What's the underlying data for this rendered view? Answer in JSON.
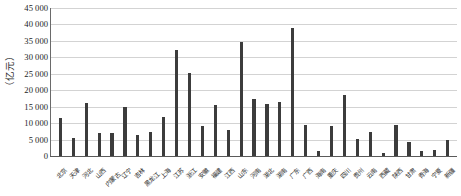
{
  "chart_data": {
    "type": "bar",
    "title": "",
    "xlabel": "",
    "ylabel": "（亿元）",
    "ylim": [
      0,
      45000
    ],
    "ytick_step": 5000,
    "grid": true,
    "legend": null,
    "bar_color": "#3c3c3c",
    "gridline_color": "#d3d3d3",
    "axis_color": "#5a5a5a",
    "ytick_labels": [
      "45 000",
      "40 000",
      "35 000",
      "30 000",
      "25 000",
      "20 000",
      "15 000",
      "10 000",
      "5 000",
      "0"
    ],
    "ytick_values": [
      45000,
      40000,
      35000,
      30000,
      25000,
      20000,
      15000,
      10000,
      5000,
      0
    ],
    "categories": [
      "北京",
      "天津",
      "河北",
      "山西",
      "内蒙古",
      "辽宁",
      "吉林",
      "黑龙江",
      "上海",
      "江苏",
      "浙江",
      "安徽",
      "福建",
      "江西",
      "山东",
      "河南",
      "湖北",
      "湖南",
      "广东",
      "广西",
      "海南",
      "重庆",
      "四川",
      "贵州",
      "云南",
      "西藏",
      "陕西",
      "甘肃",
      "青海",
      "宁夏",
      "新疆"
    ],
    "values": [
      11500,
      5500,
      16200,
      6900,
      7100,
      14800,
      6500,
      7300,
      11800,
      32200,
      25100,
      9200,
      15500,
      8000,
      34800,
      17400,
      15800,
      16500,
      39000,
      9500,
      1600,
      9000,
      18600,
      5300,
      7200,
      800,
      9500,
      4200,
      1500,
      1900,
      4800
    ],
    "value_unit": "亿元",
    "series_name": ""
  }
}
